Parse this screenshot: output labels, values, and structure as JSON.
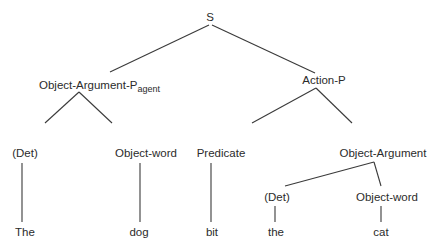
{
  "diagram": {
    "type": "syntax-tree",
    "root": {
      "label": "S",
      "children": [
        {
          "label": "Object-Argument-P",
          "subscript": "agent",
          "children": [
            {
              "label": "(Det)",
              "children": [
                {
                  "label": "The"
                }
              ]
            },
            {
              "label": "Object-word",
              "children": [
                {
                  "label": "dog"
                }
              ]
            }
          ]
        },
        {
          "label": "Action-P",
          "children": [
            {
              "label": "Predicate",
              "children": [
                {
                  "label": "bit"
                }
              ]
            },
            {
              "label": "Object-Argument",
              "children": [
                {
                  "label": "(Det)",
                  "children": [
                    {
                      "label": "the"
                    }
                  ]
                },
                {
                  "label": "Object-word",
                  "children": [
                    {
                      "label": "cat"
                    }
                  ]
                }
              ]
            }
          ]
        }
      ]
    }
  },
  "nodes": {
    "s": "S",
    "oap_agent": "Object-Argument-P",
    "oap_agent_sub": "agent",
    "action_p": "Action-P",
    "det1": "(Det)",
    "objword1": "Object-word",
    "predicate": "Predicate",
    "object_argument": "Object-Argument",
    "det2": "(Det)",
    "objword2": "Object-word",
    "leaf_the1": "The",
    "leaf_dog": "dog",
    "leaf_bit": "bit",
    "leaf_the2": "the",
    "leaf_cat": "cat"
  },
  "colors": {
    "line": "#3a3a3a",
    "text": "#2b2b2b",
    "background": "#ffffff"
  }
}
